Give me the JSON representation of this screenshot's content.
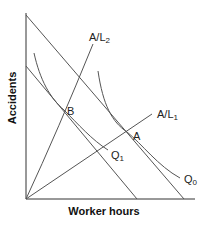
{
  "diagram": {
    "type": "isoquant-isocost",
    "axes": {
      "x_label": "Worker hours",
      "y_label": "Accidents"
    },
    "rays": [
      {
        "id": "A/L2",
        "label_main": "A/L",
        "label_sub": "2"
      },
      {
        "id": "A/L1",
        "label_main": "A/L",
        "label_sub": "1"
      }
    ],
    "curves": [
      {
        "id": "Q0",
        "label_main": "Q",
        "label_sub": "0"
      },
      {
        "id": "Q1",
        "label_main": "Q",
        "label_sub": "1"
      }
    ],
    "points": [
      {
        "id": "A",
        "label": "A"
      },
      {
        "id": "B",
        "label": "B"
      }
    ],
    "budget_lines": [
      {
        "id": "outer",
        "description": "outer isocost line tangent to Q0 at A"
      },
      {
        "id": "inner",
        "description": "inner isocost line tangent to Q1 at B"
      }
    ],
    "colors": {
      "lines": "#555555",
      "axes": "#333333",
      "text": "#222222",
      "background": "#ffffff"
    }
  }
}
